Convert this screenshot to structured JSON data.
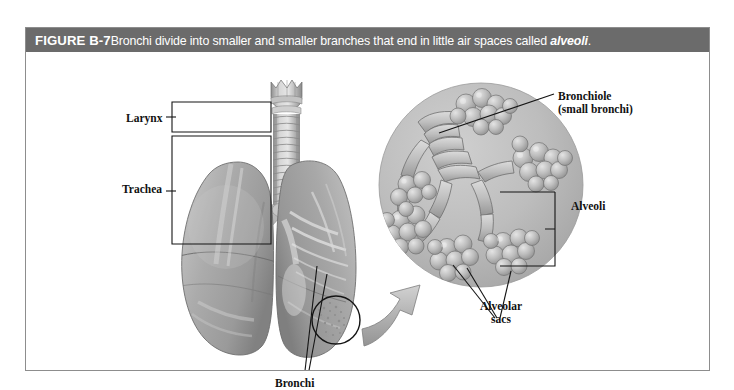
{
  "figure": {
    "number": "FIGURE B-7",
    "caption_before": "Bronchi divide into smaller and smaller branches that end in little air spaces called ",
    "caption_italic": "alveoli",
    "caption_after": ".",
    "caption_full": "FIGURE B-7 Bronchi divide into smaller and smaller branches that end in little air spaces called alveoli."
  },
  "labels": {
    "larynx": "Larynx",
    "trachea": "Trachea",
    "bronchi": "Bronchi",
    "bronchiole_line1": "Bronchiole",
    "bronchiole_line2": "(small bronchi)",
    "alveoli": "Alveoli",
    "alveolar_sacs_line1": "Alveolar",
    "alveolar_sacs_line2": "sacs"
  },
  "colors": {
    "title_bar_bg": "#6b6b6b",
    "title_text": "#ffffff",
    "frame_border": "#8d8d8d",
    "page_bg": "#ffffff",
    "label_text": "#111111",
    "leader_line": "#1a1a1a",
    "inset_circle_bg": "#b9b9b9",
    "tissue_mid": "#a8a8a8",
    "tissue_light": "#d8d8d8",
    "tissue_dark": "#8a8a8a",
    "arrow_fill": "#b5b5b5"
  },
  "artwork": {
    "left_panel": "grayscale anatomical illustration of larynx, trachea and both lungs with bronchi visible in the right lung",
    "right_panel": "circular magnified inset showing a bronchiole branching into alveolar sacs made of grape-like alveoli clusters",
    "connector": "curved gray arrow from circled region on lung to the magnified inset"
  }
}
